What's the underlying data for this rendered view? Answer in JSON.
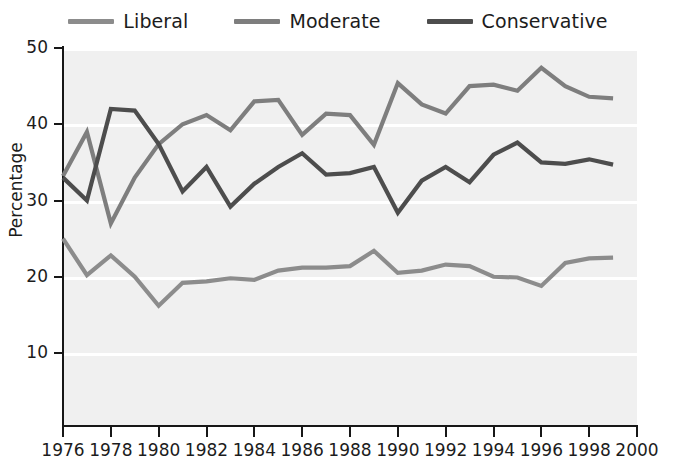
{
  "chart_data": {
    "type": "line",
    "title": "",
    "xlabel": "",
    "ylabel": "Percentage",
    "xlim": [
      1976,
      2000
    ],
    "ylim": [
      0,
      50
    ],
    "yticks": [
      10,
      20,
      30,
      40,
      50
    ],
    "xticks": [
      1976,
      1978,
      1980,
      1982,
      1984,
      1986,
      1988,
      1990,
      1992,
      1994,
      1996,
      1998,
      2000
    ],
    "grid": "horizontal-white-bands",
    "legend_position": "top-center",
    "x": [
      1976,
      1977,
      1978,
      1979,
      1980,
      1981,
      1982,
      1983,
      1984,
      1985,
      1986,
      1987,
      1988,
      1989,
      1990,
      1991,
      1992,
      1993,
      1994,
      1995,
      1996,
      1997,
      1998,
      1999
    ],
    "series": [
      {
        "name": "Liberal",
        "color": "#8c8c8c",
        "values": [
          25.0,
          20.2,
          22.8,
          20.0,
          16.2,
          19.2,
          19.4,
          19.8,
          19.6,
          20.8,
          21.2,
          21.2,
          21.4,
          23.4,
          20.5,
          20.8,
          21.6,
          21.4,
          20.0,
          19.9,
          18.8,
          21.8,
          22.4,
          22.5
        ]
      },
      {
        "name": "Moderate",
        "color": "#7e7e7e",
        "values": [
          33.2,
          39.0,
          27.0,
          33.0,
          37.4,
          40.0,
          41.2,
          39.2,
          43.0,
          43.2,
          38.6,
          41.4,
          41.2,
          37.3,
          45.4,
          42.6,
          41.4,
          45.0,
          45.2,
          44.4,
          47.4,
          45.0,
          43.6,
          43.4
        ]
      },
      {
        "name": "Conservative",
        "color": "#4d4d4d",
        "values": [
          33.0,
          30.0,
          42.0,
          41.8,
          37.4,
          31.2,
          34.4,
          29.2,
          32.2,
          34.4,
          36.2,
          33.4,
          33.6,
          34.4,
          28.4,
          32.6,
          34.4,
          32.4,
          36.0,
          37.6,
          35.0,
          34.8,
          35.4,
          34.7
        ]
      }
    ]
  },
  "legend": {
    "items": [
      {
        "label": "Liberal",
        "color": "#8c8c8c"
      },
      {
        "label": "Moderate",
        "color": "#7e7e7e"
      },
      {
        "label": "Conservative",
        "color": "#4d4d4d"
      }
    ]
  },
  "axes": {
    "y_title": "Percentage",
    "y_ticklabels": [
      "50",
      "40",
      "30",
      "20",
      "10"
    ],
    "x_ticklabels": [
      "1976",
      "1978",
      "1980",
      "1982",
      "1984",
      "1986",
      "1988",
      "1990",
      "1992",
      "1994",
      "1996",
      "1998",
      "2000"
    ]
  },
  "colors": {
    "plot_background": "#f0f0f0",
    "gridline": "#ffffff",
    "axis": "#171717",
    "text": "#1c1c1c"
  }
}
